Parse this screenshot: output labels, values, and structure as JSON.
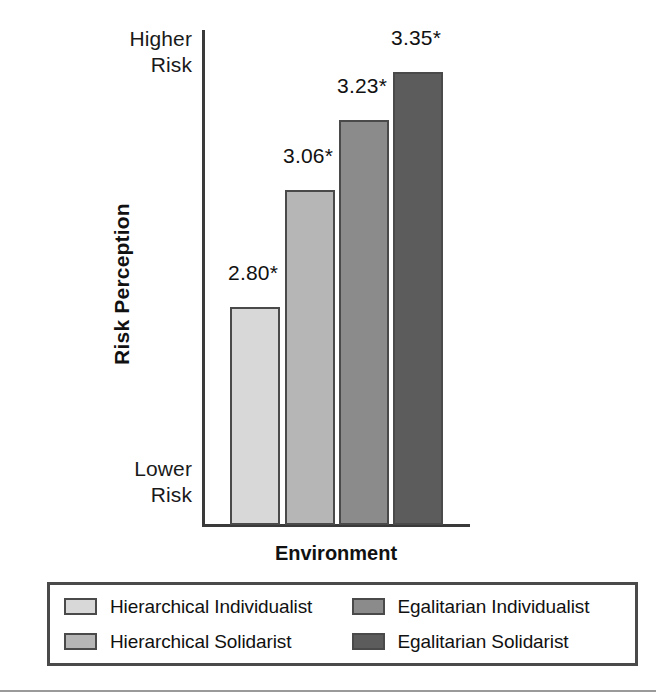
{
  "chart_data": {
    "type": "bar",
    "title": "",
    "xlabel": "Environment",
    "ylabel": "Risk Perception",
    "categories": [
      "Hierarchical Individualist",
      "Hierarchical Solidarist",
      "Egalitarian Individualist",
      "Egalitarian Solidarist"
    ],
    "values": [
      2.8,
      3.06,
      3.23,
      3.35
    ],
    "data_labels": [
      "2.80*",
      "3.06*",
      "3.23*",
      "3.35*"
    ],
    "series": [
      {
        "name": "Risk Perception",
        "values": [
          2.8,
          3.06,
          3.23,
          3.35
        ]
      }
    ],
    "colors": [
      "#d8d8d8",
      "#b6b6b6",
      "#8b8b8b",
      "#5c5c5c"
    ],
    "y_axis": {
      "top_label": "Higher Risk",
      "bottom_label": "Lower Risk",
      "tick_labels": [
        "Lower Risk",
        "Higher Risk"
      ],
      "ylim": [
        2.55,
        3.45
      ],
      "grid": false
    },
    "x_axis": {
      "grid": false
    },
    "legend": {
      "position": "bottom",
      "columns": 2,
      "entries": [
        {
          "label": "Hierarchical Individualist",
          "color": "#d8d8d8"
        },
        {
          "label": "Egalitarian Individualist",
          "color": "#8b8b8b"
        },
        {
          "label": "Hierarchical Solidarist",
          "color": "#b6b6b6"
        },
        {
          "label": "Egalitarian Solidarist",
          "color": "#5c5c5c"
        }
      ]
    },
    "annotations": [
      "* denotes statistical significance"
    ]
  },
  "axis": {
    "y_top_line1": "Higher",
    "y_top_line2": "Risk",
    "y_bottom_line1": "Lower",
    "y_bottom_line2": "Risk",
    "y_title": "Risk Perception",
    "x_title": "Environment"
  },
  "bars": [
    {
      "label": "2.80*",
      "value": 2.8,
      "color": "#d8d8d8",
      "left": 230,
      "width": 50,
      "height": 218,
      "label_left": 228,
      "label_top": 261
    },
    {
      "label": "3.06*",
      "value": 3.06,
      "color": "#b6b6b6",
      "left": 285,
      "width": 50,
      "height": 335,
      "label_left": 283,
      "label_top": 144
    },
    {
      "label": "3.23*",
      "value": 3.23,
      "color": "#8b8b8b",
      "left": 339,
      "width": 50,
      "height": 405,
      "label_left": 337,
      "label_top": 74
    },
    {
      "label": "3.35*",
      "value": 3.35,
      "color": "#5c5c5c",
      "left": 393,
      "width": 50,
      "height": 453,
      "label_left": 391,
      "label_top": 26
    }
  ],
  "legend": {
    "items": [
      {
        "label": "Hierarchical Individualist",
        "color": "#d8d8d8"
      },
      {
        "label": "Egalitarian Individualist",
        "color": "#8b8b8b"
      },
      {
        "label": "Hierarchical Solidarist",
        "color": "#b6b6b6"
      },
      {
        "label": "Egalitarian Solidarist",
        "color": "#5c5c5c"
      }
    ]
  }
}
